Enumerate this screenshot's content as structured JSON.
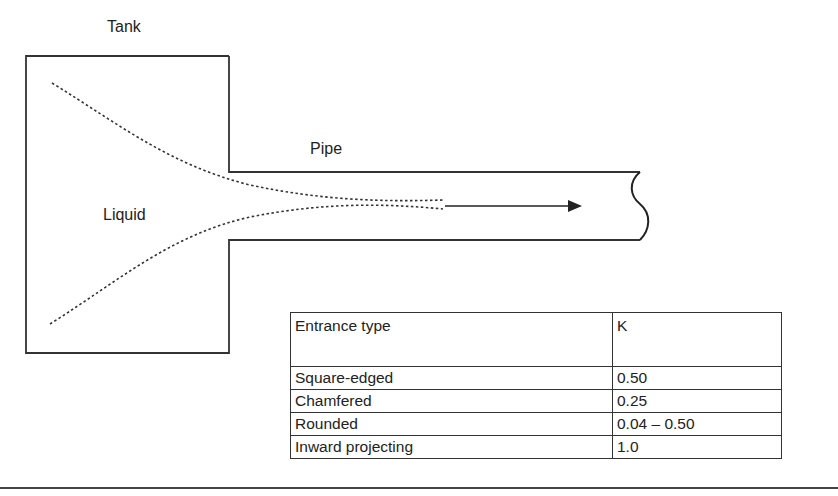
{
  "labels": {
    "tank": "Tank",
    "pipe": "Pipe",
    "liquid": "Liquid"
  },
  "table": {
    "headers": [
      "Entrance type",
      "K"
    ],
    "rows": [
      {
        "type": "Square-edged",
        "k": "0.50"
      },
      {
        "type": "Chamfered",
        "k": "0.25"
      },
      {
        "type": "Rounded",
        "k": "0.04 – 0.50"
      },
      {
        "type": "Inward projecting",
        "k": "1.0"
      }
    ]
  },
  "colors": {
    "line": "#333333",
    "background": "#ffffff"
  }
}
